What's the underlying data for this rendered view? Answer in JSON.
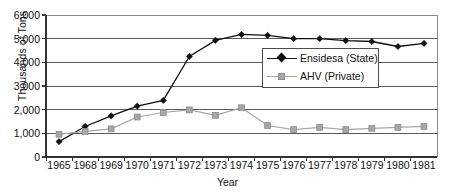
{
  "chart_data": {
    "type": "line",
    "title": "",
    "xlabel": "Year",
    "ylabel": "Thousands of Tons",
    "categories": [
      "1965",
      "1968",
      "1969",
      "1970",
      "1971",
      "1972",
      "1973",
      "1974",
      "1975",
      "1976",
      "1977",
      "1978",
      "1979",
      "1980",
      "1981"
    ],
    "yticks": [
      "0",
      "1,000",
      "2,000",
      "3,000",
      "4,000",
      "5,000",
      "6,000"
    ],
    "ylim": [
      0,
      6000
    ],
    "grid": true,
    "legend_position": "center-right",
    "series": [
      {
        "name": "Ensidesa (State)",
        "marker": "diamond",
        "color": "#111111",
        "values": [
          650,
          1290,
          1740,
          2150,
          2390,
          4250,
          4930,
          5180,
          5140,
          5000,
          5000,
          4920,
          4880,
          4670,
          4800
        ]
      },
      {
        "name": "AHV (Private)",
        "marker": "square",
        "color": "#a6a6a6",
        "values": [
          960,
          1080,
          1190,
          1690,
          1880,
          1990,
          1760,
          2080,
          1330,
          1160,
          1250,
          1160,
          1210,
          1250,
          1290
        ]
      }
    ]
  },
  "axis": {
    "y_title": "Thousands of Tons",
    "x_title": "Year"
  },
  "legend": {
    "items": [
      {
        "label": "Ensidesa (State)",
        "marker": "diamond-marker",
        "color": "#111111"
      },
      {
        "label": "AHV (Private)",
        "marker": "square-marker",
        "color": "#a6a6a6"
      }
    ]
  },
  "colors": {
    "series_state": "#111111",
    "series_private": "#a6a6a6",
    "grid": "#595959",
    "grid_top": "#8c8c8c",
    "axis": "#333333",
    "background": "#ffffff"
  }
}
